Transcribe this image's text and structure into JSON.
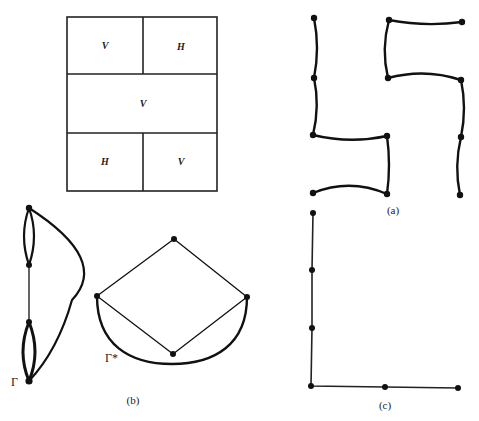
{
  "figure": {
    "partition": {
      "cells": [
        {
          "label": "V",
          "x": 67,
          "y": 17,
          "w": 76,
          "h": 57
        },
        {
          "label": "H",
          "x": 143,
          "y": 17,
          "w": 74,
          "h": 57
        },
        {
          "label": "V",
          "x": 67,
          "y": 74,
          "w": 150,
          "h": 59
        },
        {
          "label": "H",
          "x": 67,
          "y": 133,
          "w": 76,
          "h": 58
        },
        {
          "label": "V",
          "x": 143,
          "y": 133,
          "w": 74,
          "h": 58
        }
      ]
    },
    "panel_a": {
      "caption": "(a)",
      "vertices": [
        [
          314,
          18
        ],
        [
          314,
          78
        ],
        [
          313,
          135
        ],
        [
          313,
          193
        ],
        [
          389,
          20
        ],
        [
          462,
          22
        ],
        [
          388,
          78
        ],
        [
          461,
          80
        ],
        [
          387,
          136
        ],
        [
          387,
          194
        ],
        [
          461,
          137
        ],
        [
          460,
          195
        ]
      ]
    },
    "panel_b": {
      "caption": "(b)",
      "gamma_label": "Γ",
      "gamma_star_label": "Γ*",
      "gamma_vertices": [
        [
          29,
          208
        ],
        [
          29,
          265
        ],
        [
          29,
          322
        ],
        [
          29,
          381
        ]
      ],
      "gamma_star_vertices": [
        [
          174,
          239
        ],
        [
          97,
          296
        ],
        [
          247,
          297
        ],
        [
          173,
          354
        ]
      ]
    },
    "panel_c": {
      "caption": "(c)",
      "vertices": [
        [
          313,
          213
        ],
        [
          312,
          270
        ],
        [
          312,
          328
        ],
        [
          311,
          386
        ],
        [
          385,
          387
        ],
        [
          458,
          388
        ]
      ]
    }
  }
}
